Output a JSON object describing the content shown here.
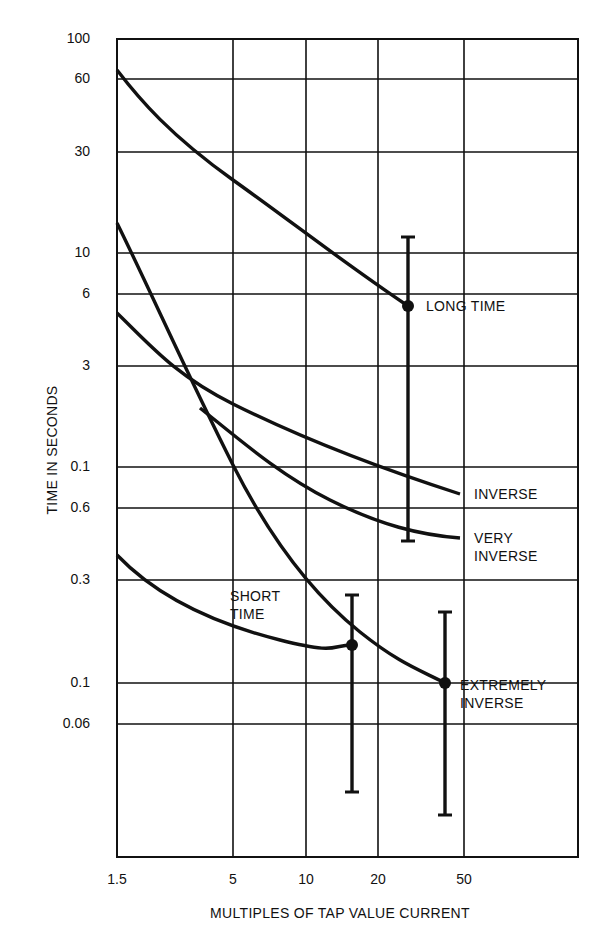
{
  "chart_data": {
    "type": "line",
    "title": "",
    "xlabel": "MULTIPLES OF TAP VALUE CURRENT",
    "ylabel": "TIME IN SECONDS",
    "x_scale": "log",
    "y_scale": "log",
    "grid": true,
    "x_ticks": [
      "1.5",
      "5",
      "10",
      "20",
      "50"
    ],
    "y_ticks": [
      "100",
      "60",
      "30",
      "10",
      "6",
      "3",
      "0.1",
      "0.6",
      "0.3",
      "0.1",
      "0.06"
    ],
    "xlim": [
      1.5,
      100
    ],
    "ylim": [
      0.02,
      100
    ],
    "series": [
      {
        "name": "LONG TIME",
        "points": [
          [
            1.5,
            65
          ],
          [
            2.2,
            40
          ],
          [
            5,
            22
          ],
          [
            10,
            14
          ],
          [
            20,
            8
          ],
          [
            25,
            5.5
          ]
        ],
        "marker": {
          "x": 25,
          "y": 5.5
        },
        "band": {
          "x": 25,
          "min": 0.5,
          "max": 12
        }
      },
      {
        "name": "INVERSE",
        "points": [
          [
            1.5,
            5
          ],
          [
            2.2,
            3.2
          ],
          [
            3,
            2.5
          ],
          [
            5,
            2.1
          ],
          [
            10,
            1.4
          ],
          [
            20,
            0.95
          ],
          [
            50,
            0.75
          ]
        ]
      },
      {
        "name": "VERY INVERSE",
        "points": [
          [
            3,
            2.0
          ],
          [
            5,
            1.4
          ],
          [
            10,
            0.9
          ],
          [
            20,
            0.6
          ],
          [
            50,
            0.5
          ]
        ]
      },
      {
        "name": "EXTREMELY INVERSE",
        "points": [
          [
            1.5,
            13
          ],
          [
            2.2,
            4.5
          ],
          [
            3.5,
            2.0
          ],
          [
            5,
            1.0
          ],
          [
            10,
            0.3
          ],
          [
            15,
            0.17
          ],
          [
            20,
            0.13
          ],
          [
            40,
            0.1
          ]
        ],
        "marker": {
          "x": 40,
          "y": 0.1
        },
        "band": {
          "x": 40,
          "min": 0.022,
          "max": 0.2
        }
      },
      {
        "name": "SHORT TIME",
        "points": [
          [
            1.5,
            0.4
          ],
          [
            2.2,
            0.3
          ],
          [
            4,
            0.2
          ],
          [
            7,
            0.16
          ],
          [
            15,
            0.15
          ]
        ],
        "marker": {
          "x": 15,
          "y": 0.15
        },
        "band": {
          "x": 15,
          "min": 0.027,
          "max": 0.25
        }
      }
    ],
    "labels": {
      "long_time": "LONG TIME",
      "inverse": "INVERSE",
      "very_inverse_1": "VERY",
      "very_inverse_2": "INVERSE",
      "short_time_1": "SHORT",
      "short_time_2": "TIME",
      "extremely_inverse_1": "EXTREMELY",
      "extremely_inverse_2": "INVERSE"
    }
  },
  "pixel_layout": {
    "plot": {
      "left": 117,
      "top": 39,
      "right": 578,
      "bottom": 857
    },
    "vgrid_x": [
      233,
      306,
      378,
      464
    ],
    "hgrid_y": [
      79,
      152,
      253,
      294,
      366,
      467,
      508,
      580,
      683,
      724
    ],
    "ytick_y": [
      39,
      79,
      152,
      253,
      294,
      366,
      467,
      508,
      580,
      683,
      724
    ],
    "xtick_x": [
      117,
      233,
      306,
      378,
      464
    ],
    "curves": {
      "long_time": "M117,70 C140,100 170,135 233,180 S340,260 408,306",
      "inverse": "M117,313 C150,345 175,375 233,404 S360,462 460,494",
      "very_inverse": "M200,408 C240,440 280,475 330,500 S420,535 460,538",
      "extremely_inverse": "M117,223 C150,290 190,380 233,465 S320,600 360,632 S420,670 445,683",
      "short_time": "M117,555 C160,600 220,625 280,640 S330,645 352,645"
    },
    "bars": [
      {
        "name": "long-time-band",
        "x": 408,
        "top": 237,
        "bottom": 541,
        "dot": 306
      },
      {
        "name": "short-time-band",
        "x": 352,
        "top": 595,
        "bottom": 792,
        "dot": 645
      },
      {
        "name": "extremely-inverse-band",
        "x": 445,
        "top": 612,
        "bottom": 815,
        "dot": 683
      }
    ]
  }
}
